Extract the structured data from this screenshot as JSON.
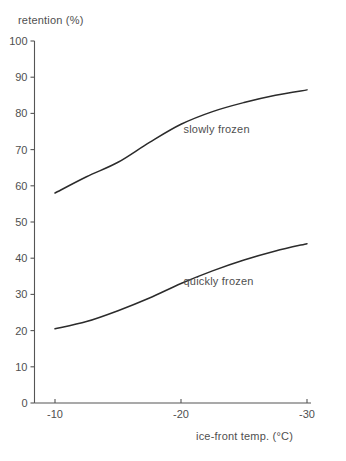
{
  "chart_data": {
    "type": "line",
    "title": "",
    "xlabel": "ice-front temp. (°C)",
    "ylabel": "retention (%)",
    "x": [
      -10,
      -20,
      -30
    ],
    "xlim": [
      -8.8,
      -30.6
    ],
    "ylim": [
      0,
      100
    ],
    "xticks": [
      -10,
      -20,
      -30
    ],
    "xtick_labels": [
      "-10",
      "-20",
      "-30"
    ],
    "yticks": [
      0,
      10,
      20,
      30,
      40,
      50,
      60,
      70,
      80,
      90,
      100
    ],
    "ytick_labels": [
      "0",
      "10",
      "20",
      "30",
      "40",
      "50",
      "60",
      "70",
      "80",
      "90",
      "100"
    ],
    "grid": false,
    "legend": "inline-annotations",
    "series": [
      {
        "name": "slowly frozen",
        "values": [
          58,
          77,
          86.5
        ],
        "detail_x": [
          -10,
          -12.5,
          -15,
          -17.5,
          -20,
          -22.5,
          -25,
          -27.5,
          -30
        ],
        "detail_values": [
          58,
          62.5,
          66.5,
          72,
          77,
          80.5,
          83,
          85,
          86.5
        ],
        "color": "#2b2b2b"
      },
      {
        "name": "quickly frozen",
        "values": [
          20.5,
          33,
          44
        ],
        "detail_x": [
          -10,
          -12.5,
          -15,
          -17.5,
          -20,
          -22.5,
          -25,
          -27.5,
          -30
        ],
        "detail_values": [
          20.5,
          22.5,
          25.5,
          29,
          33,
          36.5,
          39.5,
          42,
          44
        ],
        "color": "#2b2b2b"
      }
    ],
    "annotations": [
      {
        "text": "slowly frozen",
        "x": -20.2,
        "y": 74.5
      },
      {
        "text": "quickly frozen",
        "x": -20.2,
        "y": 32.5
      }
    ]
  }
}
